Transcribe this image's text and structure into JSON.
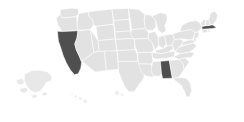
{
  "map": {
    "title": "United States choropleth map",
    "region_label": "United States",
    "projection": "albers-usa",
    "background_color": "#ffffff",
    "default_state_color": "#e2e2e2",
    "selected_state_color": "#4f4f4f",
    "border_color": "#ffffff",
    "selected_count": "3",
    "selected_states": [
      {
        "code": "CA",
        "name": "California",
        "color": "#4f4f4f",
        "selected": true
      },
      {
        "code": "AL",
        "name": "Alabama",
        "color": "#4f4f4f",
        "selected": true
      },
      {
        "code": "MA",
        "name": "Massachusetts",
        "color": "#4f4f4f",
        "selected": true
      }
    ],
    "insets": [
      {
        "code": "AK",
        "name": "Alaska",
        "color": "#e2e2e2",
        "selected": false
      },
      {
        "code": "HI",
        "name": "Hawaii",
        "color": "#ededed",
        "selected": false
      }
    ],
    "states": [
      {
        "code": "WA",
        "name": "Washington",
        "selected": false
      },
      {
        "code": "OR",
        "name": "Oregon",
        "selected": false
      },
      {
        "code": "CA",
        "name": "California",
        "selected": true
      },
      {
        "code": "NV",
        "name": "Nevada",
        "selected": false
      },
      {
        "code": "ID",
        "name": "Idaho",
        "selected": false
      },
      {
        "code": "MT",
        "name": "Montana",
        "selected": false
      },
      {
        "code": "WY",
        "name": "Wyoming",
        "selected": false
      },
      {
        "code": "UT",
        "name": "Utah",
        "selected": false
      },
      {
        "code": "AZ",
        "name": "Arizona",
        "selected": false
      },
      {
        "code": "CO",
        "name": "Colorado",
        "selected": false
      },
      {
        "code": "NM",
        "name": "New Mexico",
        "selected": false
      },
      {
        "code": "ND",
        "name": "North Dakota",
        "selected": false
      },
      {
        "code": "SD",
        "name": "South Dakota",
        "selected": false
      },
      {
        "code": "NE",
        "name": "Nebraska",
        "selected": false
      },
      {
        "code": "KS",
        "name": "Kansas",
        "selected": false
      },
      {
        "code": "OK",
        "name": "Oklahoma",
        "selected": false
      },
      {
        "code": "TX",
        "name": "Texas",
        "selected": false
      },
      {
        "code": "MN",
        "name": "Minnesota",
        "selected": false
      },
      {
        "code": "IA",
        "name": "Iowa",
        "selected": false
      },
      {
        "code": "MO",
        "name": "Missouri",
        "selected": false
      },
      {
        "code": "AR",
        "name": "Arkansas",
        "selected": false
      },
      {
        "code": "LA",
        "name": "Louisiana",
        "selected": false
      },
      {
        "code": "WI",
        "name": "Wisconsin",
        "selected": false
      },
      {
        "code": "IL",
        "name": "Illinois",
        "selected": false
      },
      {
        "code": "MI",
        "name": "Michigan",
        "selected": false
      },
      {
        "code": "IN",
        "name": "Indiana",
        "selected": false
      },
      {
        "code": "OH",
        "name": "Ohio",
        "selected": false
      },
      {
        "code": "KY",
        "name": "Kentucky",
        "selected": false
      },
      {
        "code": "TN",
        "name": "Tennessee",
        "selected": false
      },
      {
        "code": "MS",
        "name": "Mississippi",
        "selected": false
      },
      {
        "code": "AL",
        "name": "Alabama",
        "selected": true
      },
      {
        "code": "GA",
        "name": "Georgia",
        "selected": false
      },
      {
        "code": "FL",
        "name": "Florida",
        "selected": false
      },
      {
        "code": "SC",
        "name": "South Carolina",
        "selected": false
      },
      {
        "code": "NC",
        "name": "North Carolina",
        "selected": false
      },
      {
        "code": "VA",
        "name": "Virginia",
        "selected": false
      },
      {
        "code": "WV",
        "name": "West Virginia",
        "selected": false
      },
      {
        "code": "MD",
        "name": "Maryland",
        "selected": false
      },
      {
        "code": "DE",
        "name": "Delaware",
        "selected": false
      },
      {
        "code": "PA",
        "name": "Pennsylvania",
        "selected": false
      },
      {
        "code": "NJ",
        "name": "New Jersey",
        "selected": false
      },
      {
        "code": "NY",
        "name": "New York",
        "selected": false
      },
      {
        "code": "CT",
        "name": "Connecticut",
        "selected": false
      },
      {
        "code": "RI",
        "name": "Rhode Island",
        "selected": false
      },
      {
        "code": "MA",
        "name": "Massachusetts",
        "selected": true
      },
      {
        "code": "VT",
        "name": "Vermont",
        "selected": false
      },
      {
        "code": "NH",
        "name": "New Hampshire",
        "selected": false
      },
      {
        "code": "ME",
        "name": "Maine",
        "selected": false
      }
    ]
  }
}
